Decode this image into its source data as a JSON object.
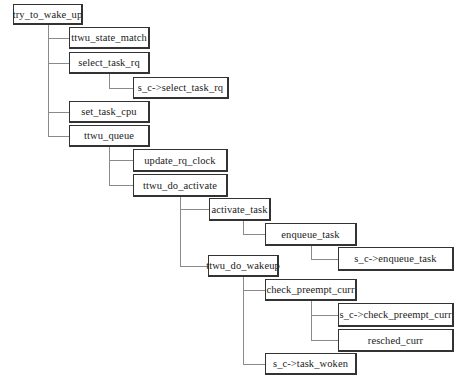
{
  "diagram": {
    "type": "call-tree",
    "root": "try_to_wake_up",
    "nodes": [
      {
        "id": "n0",
        "label": "try_to_wake_up",
        "parent": null,
        "x": 13,
        "y": 4,
        "w": 70,
        "h": 21
      },
      {
        "id": "n1",
        "label": "ttwu_state_match",
        "parent": "n0",
        "x": 69,
        "y": 27,
        "w": 81,
        "h": 22
      },
      {
        "id": "n2",
        "label": "select_task_rq",
        "parent": "n0",
        "x": 69,
        "y": 52,
        "w": 81,
        "h": 22
      },
      {
        "id": "n3",
        "label": "s_c->select_task_rq",
        "parent": "n2",
        "x": 133,
        "y": 77,
        "w": 96,
        "h": 22
      },
      {
        "id": "n4",
        "label": "set_task_cpu",
        "parent": "n0",
        "x": 69,
        "y": 101,
        "w": 81,
        "h": 22
      },
      {
        "id": "n5",
        "label": "ttwu_queue",
        "parent": "n0",
        "x": 69,
        "y": 125,
        "w": 81,
        "h": 22
      },
      {
        "id": "n6",
        "label": "update_rq_clock",
        "parent": "n5",
        "x": 133,
        "y": 149,
        "w": 95,
        "h": 23
      },
      {
        "id": "n7",
        "label": "ttwu_do_activate",
        "parent": "n5",
        "x": 133,
        "y": 174,
        "w": 95,
        "h": 23
      },
      {
        "id": "n8",
        "label": "activate_task",
        "parent": "n7",
        "x": 209,
        "y": 198,
        "w": 62,
        "h": 23
      },
      {
        "id": "n9",
        "label": "enqueue_task",
        "parent": "n8",
        "x": 265,
        "y": 223,
        "w": 92,
        "h": 23
      },
      {
        "id": "n10",
        "label": "s_c->enqueue_task",
        "parent": "n9",
        "x": 338,
        "y": 247,
        "w": 116,
        "h": 24
      },
      {
        "id": "n11",
        "label": "ttwu_do_wakeup",
        "parent": "n7",
        "x": 208,
        "y": 255,
        "w": 71,
        "h": 22
      },
      {
        "id": "n12",
        "label": "check_preempt_curr",
        "parent": "n11",
        "x": 265,
        "y": 279,
        "w": 92,
        "h": 22
      },
      {
        "id": "n13",
        "label": "s_c->check_preempt_curr",
        "parent": "n12",
        "x": 338,
        "y": 303,
        "w": 116,
        "h": 24
      },
      {
        "id": "n14",
        "label": "resched_curr",
        "parent": "n12",
        "x": 338,
        "y": 329,
        "w": 116,
        "h": 23
      },
      {
        "id": "n15",
        "label": "s_c->task_woken",
        "parent": "n11",
        "x": 265,
        "y": 353,
        "w": 92,
        "h": 22
      }
    ],
    "colors": {
      "box_border": "#333333",
      "connector": "#8a8a8a",
      "text": "#222222",
      "background": "#ffffff"
    }
  }
}
